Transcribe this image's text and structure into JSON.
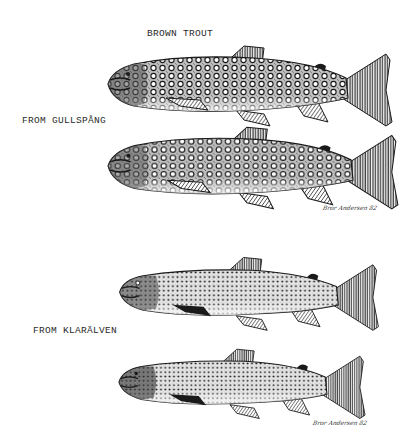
{
  "title": "BROWN TROUT",
  "groups": [
    {
      "label": "FROM GULLSPÅNG",
      "signature": "Bror Andersen 82"
    },
    {
      "label": "FROM KLARÄLVEN",
      "signature": "Bror Andersen 82"
    }
  ],
  "fish": [
    {
      "name": "brown-trout-gullspang-1",
      "spot_style": "ocellated"
    },
    {
      "name": "brown-trout-gullspang-2",
      "spot_style": "ocellated"
    },
    {
      "name": "brown-trout-klaralven-1",
      "spot_style": "dense-dark"
    },
    {
      "name": "brown-trout-klaralven-2",
      "spot_style": "dense-dark"
    }
  ],
  "colors": {
    "ink": "#1a1a1a",
    "paper": "#ffffff"
  }
}
